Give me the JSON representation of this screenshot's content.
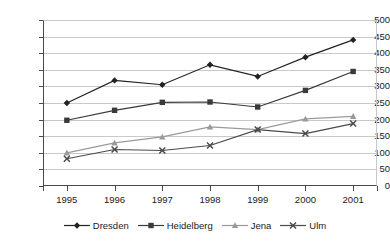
{
  "chart_data": {
    "type": "line",
    "title": "",
    "subtitle": "",
    "xlabel": "",
    "ylabel": "",
    "categories": [
      "1995",
      "1996",
      "1997",
      "1998",
      "1999",
      "2000",
      "2001"
    ],
    "x": [
      1995,
      1996,
      1997,
      1998,
      1999,
      2000,
      2001
    ],
    "ylim": [
      0,
      500
    ],
    "yticks": [
      0,
      50,
      100,
      150,
      200,
      250,
      300,
      350,
      400,
      450,
      500
    ],
    "ytick_labels": [
      "0",
      "50",
      "100",
      "150",
      "200",
      "250",
      "300",
      "350",
      "400",
      "450",
      "500"
    ],
    "grid": "horizontal",
    "legend_position": "bottom",
    "series": [
      {
        "name": "Dresden",
        "marker": "diamond",
        "color": "#222222",
        "values": [
          250,
          318,
          305,
          365,
          330,
          388,
          440
        ]
      },
      {
        "name": "Heidelberg",
        "marker": "square",
        "color": "#3a3a3a",
        "values": [
          198,
          228,
          252,
          253,
          238,
          288,
          345
        ]
      },
      {
        "name": "Jena",
        "marker": "triangle",
        "color": "#9a9a9a",
        "values": [
          100,
          130,
          148,
          178,
          170,
          202,
          210
        ]
      },
      {
        "name": "Ulm",
        "marker": "cross-x",
        "color": "#4a4a4a",
        "values": [
          82,
          110,
          107,
          122,
          170,
          158,
          188
        ]
      }
    ]
  },
  "legend": {
    "items": [
      {
        "label": "Dresden"
      },
      {
        "label": "Heidelberg"
      },
      {
        "label": "Jena"
      },
      {
        "label": "Ulm"
      }
    ]
  }
}
